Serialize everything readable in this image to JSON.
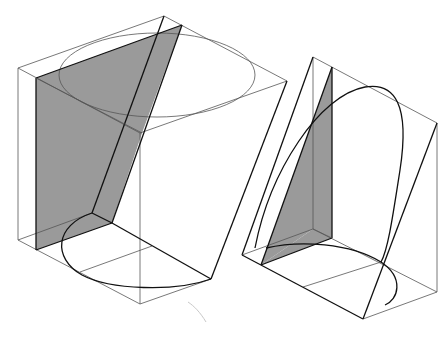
{
  "diagram": {
    "colors": {
      "background": "#ffffff",
      "shade": "#9a9a9a",
      "thin_line": "#555555",
      "thick_line": "#111111"
    },
    "figures": [
      {
        "id": "left-box",
        "outer_box": {
          "top": [
            [
              18,
              68
            ],
            [
              164,
              16
            ],
            [
              287,
              81
            ],
            [
              140,
              133
            ]
          ],
          "bottom": [
            [
              18,
              240
            ],
            [
              140,
              304
            ],
            [
              211,
              279
            ]
          ],
          "verticals": [
            [
              [
                18,
                68
              ],
              [
                18,
                240
              ]
            ],
            [
              [
                140,
                133
              ],
              [
                140,
                304
              ]
            ]
          ]
        },
        "shaded_plane": [
          [
            36,
            78
          ],
          [
            182,
            25
          ],
          [
            112,
            223
          ],
          [
            36,
            250
          ]
        ],
        "top_ellipse": {
          "cx": 157,
          "cy": 75,
          "rx": 98,
          "ry": 42
        },
        "bottom_ellipse": {
          "cx": 140,
          "cy": 265,
          "rx": 82,
          "ry": 43
        }
      },
      {
        "id": "right-box",
        "outer_box": {
          "top": [
            [
              313,
              57
            ],
            [
              437,
              123
            ]
          ],
          "bottom": [
            [
              242,
              255
            ],
            [
              363,
              319
            ],
            [
              437,
              292
            ]
          ]
        },
        "shaded_plane": [
          [
            332,
            67
          ],
          [
            332,
            238
          ],
          [
            261,
            265
          ]
        ],
        "inner_vertex": [
          313,
          229
        ],
        "loop_curve": true,
        "bottom_ellipse": {
          "cx": 345,
          "cy": 277,
          "rx": 52,
          "ry": 30
        }
      }
    ]
  }
}
